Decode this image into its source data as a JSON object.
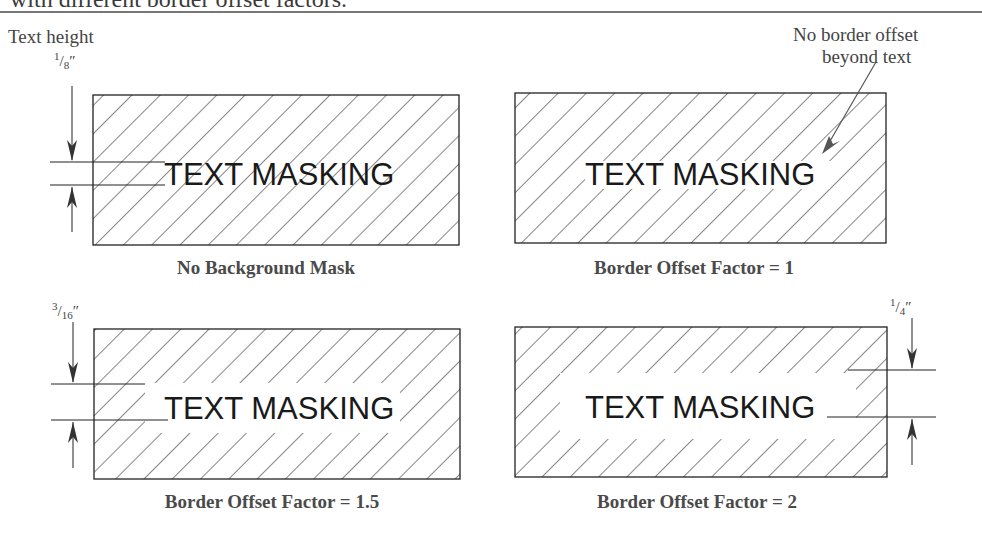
{
  "heading": {
    "partial_text": "with different border offset factors."
  },
  "annotations": {
    "text_height_label": "Text height",
    "text_height_value": {
      "num": "1",
      "den": "8",
      "unit": "″"
    },
    "callout_line1": "No border offset",
    "callout_line2": "beyond text",
    "offset_1_5_value": {
      "num": "3",
      "den": "16",
      "unit": "″"
    },
    "offset_2_value": {
      "num": "1",
      "den": "4",
      "unit": "″"
    }
  },
  "panels": [
    {
      "id": "no-mask",
      "mask_text": "TEXT MASKING",
      "caption": "No Background Mask",
      "border_offset_factor": null
    },
    {
      "id": "factor-1",
      "mask_text": "TEXT MASKING",
      "caption": "Border Offset Factor = 1",
      "border_offset_factor": 1
    },
    {
      "id": "factor-1-5",
      "mask_text": "TEXT MASKING",
      "caption": "Border Offset Factor = 1.5",
      "border_offset_factor": 1.5
    },
    {
      "id": "factor-2",
      "mask_text": "TEXT MASKING",
      "caption": "Border Offset Factor = 2",
      "border_offset_factor": 2
    }
  ],
  "colors": {
    "line": "#222222",
    "text": "#444444",
    "background": "#ffffff"
  }
}
